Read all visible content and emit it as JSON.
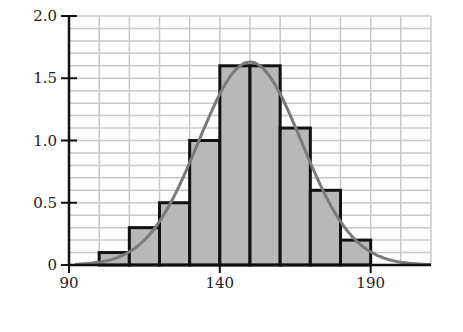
{
  "chart_data": {
    "type": "bar",
    "subtype": "histogram_with_normal_curve",
    "title": "",
    "xlabel": "",
    "ylabel": "",
    "bins": [
      [
        100,
        110
      ],
      [
        110,
        120
      ],
      [
        120,
        130
      ],
      [
        130,
        140
      ],
      [
        140,
        150
      ],
      [
        150,
        160
      ],
      [
        160,
        170
      ],
      [
        170,
        180
      ],
      [
        180,
        190
      ]
    ],
    "categories": [
      "100-110",
      "110-120",
      "120-130",
      "130-140",
      "140-150",
      "150-160",
      "160-170",
      "170-180",
      "180-190"
    ],
    "values": [
      0.1,
      0.3,
      0.5,
      1.0,
      1.6,
      1.6,
      1.1,
      0.6,
      0.2
    ],
    "curve": {
      "type": "normal",
      "mean": 150,
      "sd": 17.1,
      "peak": 1.63
    },
    "xlim": [
      90,
      210
    ],
    "ylim": [
      0,
      2.0
    ],
    "x_ticks": [
      90,
      140,
      190
    ],
    "x_tick_labels": [
      "90",
      "140",
      "190"
    ],
    "y_ticks": [
      0,
      0.5,
      1.0,
      1.5,
      2.0
    ],
    "y_tick_labels": [
      "0",
      "0.5",
      "1.0",
      "1.5",
      "2.0"
    ],
    "grid": {
      "on": true,
      "x_step": 10,
      "y_step": 0.1
    },
    "legend": null,
    "colors": {
      "bar_fill": "#b8b8b8",
      "bar_edge": "#111111",
      "curve": "#7a7a7a",
      "grid": "#c8c8c8",
      "axis": "#111111"
    }
  }
}
